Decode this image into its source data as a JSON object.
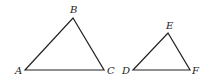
{
  "triangles": [
    {
      "name": "ABC",
      "vertices": [
        {
          "label": "A",
          "x": 25,
          "y": 70,
          "lx": 15,
          "ly": 74
        },
        {
          "label": "B",
          "x": 73,
          "y": 18,
          "lx": 70,
          "ly": 13
        },
        {
          "label": "C",
          "x": 104,
          "y": 70,
          "lx": 107,
          "ly": 74
        }
      ]
    },
    {
      "name": "DEF",
      "vertices": [
        {
          "label": "D",
          "x": 133,
          "y": 70,
          "lx": 122,
          "ly": 74
        },
        {
          "label": "E",
          "x": 168,
          "y": 33,
          "lx": 166,
          "ly": 29
        },
        {
          "label": "F",
          "x": 190,
          "y": 70,
          "lx": 192,
          "ly": 74
        }
      ]
    }
  ],
  "colors": {
    "stroke": "#222222"
  }
}
